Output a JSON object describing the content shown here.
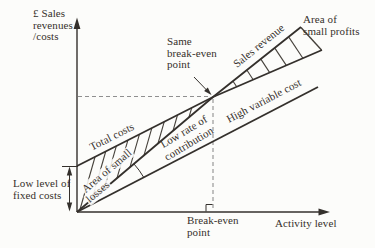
{
  "figure": {
    "title_semantic": "Break-even chart: low fixed costs with high variable cost, same break-even point",
    "background": "#fcfcfa",
    "ink_color": "#34302c",
    "dash_color": "#8f8f8f",
    "labels": {
      "y_axis": "£ Sales\nrevenues\n/costs",
      "x_axis": "Activity level",
      "same_break_even": "Same\nbreak-even\npoint",
      "sales_revenue": "Sales revenue",
      "area_small_profits": "Area of\nsmall profits",
      "total_costs": "Total costs",
      "area_small_losses_line1": "Area of small",
      "area_small_losses_line2": "losses",
      "low_rate_line1": "Low rate of",
      "low_rate_line2": "contribution",
      "high_variable_cost": "High variable cost",
      "low_fixed_costs": "Low level of\nfixed costs",
      "break_even_point": "Break-even\npoint"
    },
    "lines": [
      {
        "name": "sales-revenue-line",
        "from": "origin",
        "slope": "steepest"
      },
      {
        "name": "total-costs-line",
        "from": "fixed-costs-intercept",
        "slope": "parallel to variable cost"
      },
      {
        "name": "variable-cost-line",
        "from": "origin",
        "slope": "high variable cost"
      }
    ],
    "annotations": [
      "hatched area of small losses between total costs and sales revenue before break-even",
      "hatched area of small profits between sales revenue and total costs after break-even",
      "angle arc at origin marking low rate of contribution",
      "dashed guides from axes to break-even point",
      "double-headed arrow marking low level of fixed costs on y-axis"
    ]
  }
}
